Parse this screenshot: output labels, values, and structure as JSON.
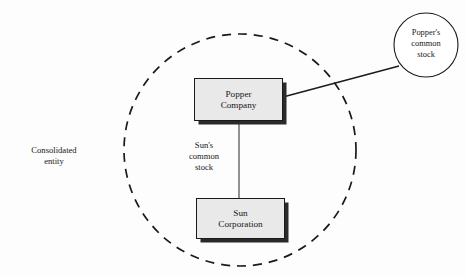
{
  "diagram": {
    "type": "consolidation-ownership-diagram",
    "title": "",
    "colors": {
      "box_fill": "#e9e9e9",
      "box_border": "#1a1a1a",
      "box_shadow": "#2a2a2a",
      "line": "#1a1a1a",
      "background": "#fdfdfd",
      "text": "#171717"
    },
    "consolidated_entity": {
      "label_lines": [
        "Consolidated",
        "entity"
      ],
      "boundary_shape": "dashed-circle",
      "boundary": {
        "cx": 240,
        "cy": 150,
        "r": 116,
        "dash": "9 7"
      }
    },
    "entities": [
      {
        "id": "popper-company",
        "name_lines": [
          "Popper",
          "Company"
        ],
        "shape": "rectangle-with-shadow",
        "inside_boundary": true
      },
      {
        "id": "sun-corporation",
        "name_lines": [
          "Sun",
          "Corporation"
        ],
        "shape": "rectangle-with-shadow",
        "inside_boundary": true
      }
    ],
    "external_nodes": [
      {
        "id": "poppers-common-stock",
        "label_lines": [
          "Popper's",
          "common",
          "stock"
        ],
        "shape": "circle",
        "inside_boundary": false,
        "geometry": {
          "cx": 426,
          "cy": 45,
          "r": 32
        }
      }
    ],
    "connectors": [
      {
        "id": "sun-common-stock-connector",
        "from": "popper-company",
        "to": "sun-corporation",
        "label_lines": [
          "Sun's",
          "common",
          "stock"
        ],
        "orientation": "vertical"
      },
      {
        "id": "popper-common-stock-connector",
        "from": "popper-company",
        "to": "poppers-common-stock",
        "label_lines": [],
        "orientation": "diagonal"
      }
    ]
  }
}
